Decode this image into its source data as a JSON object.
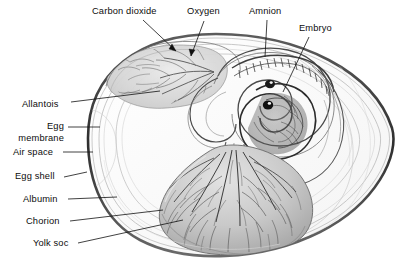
{
  "figure": {
    "style": "pencil-shaded anatomical line drawing, grayscale",
    "background_color": "#ffffff",
    "ink_color": "#1a1a1a"
  },
  "labels": [
    {
      "id": "carbon-dioxide",
      "text": "Carbon dioxide",
      "x": 92,
      "y": 8,
      "align": "left",
      "leader": {
        "type": "arrow",
        "from": [
          143,
          20
        ],
        "to": [
          178,
          52
        ]
      }
    },
    {
      "id": "oxygen",
      "text": "Oxygen",
      "x": 187,
      "y": 8,
      "align": "left",
      "leader": {
        "type": "arrow",
        "from": [
          204,
          20
        ],
        "to": [
          190,
          58
        ]
      }
    },
    {
      "id": "amnion",
      "text": "Amnion",
      "x": 249,
      "y": 8,
      "align": "left",
      "leader": {
        "type": "line",
        "from": [
          267,
          20
        ],
        "to": [
          265,
          56
        ]
      }
    },
    {
      "id": "embryo",
      "text": "Embryo",
      "x": 299,
      "y": 25,
      "align": "left",
      "leader": {
        "type": "line",
        "from": [
          309,
          37
        ],
        "to": [
          283,
          91
        ]
      }
    },
    {
      "id": "allantois",
      "text": "Allantois",
      "x": 22,
      "y": 101,
      "align": "left",
      "leader": {
        "type": "line",
        "from": [
          70,
          105
        ],
        "to": [
          158,
          90
        ]
      }
    },
    {
      "id": "egg-membrane",
      "text": "Egg\nmembrane",
      "lines": [
        "Egg",
        "membrane"
      ],
      "x": 15,
      "y": 124,
      "align": "right",
      "leader": {
        "type": "line",
        "from": [
          68,
          129
        ],
        "to": [
          99,
          129
        ]
      }
    },
    {
      "id": "air-space",
      "text": "Air space",
      "x": 14,
      "y": 150,
      "align": "left",
      "leader": {
        "type": "line",
        "from": [
          63,
          154
        ],
        "to": [
          92,
          154
        ]
      }
    },
    {
      "id": "egg-shell",
      "text": "Egg shell",
      "x": 15,
      "y": 174,
      "align": "left",
      "leader": {
        "type": "line",
        "from": [
          64,
          178
        ],
        "to": [
          86,
          174
        ]
      }
    },
    {
      "id": "albumin",
      "text": "Albumin",
      "x": 23,
      "y": 197,
      "align": "left",
      "leader": {
        "type": "line",
        "from": [
          68,
          201
        ],
        "to": [
          116,
          199
        ]
      }
    },
    {
      "id": "chorion",
      "text": "Chorion",
      "x": 26,
      "y": 219,
      "align": "left",
      "leader": {
        "type": "line",
        "from": [
          70,
          223
        ],
        "to": [
          160,
          212
        ]
      }
    },
    {
      "id": "yolk-soc",
      "text": "Yolk soc",
      "x": 33,
      "y": 241,
      "align": "left",
      "leader": {
        "type": "line",
        "from": [
          78,
          245
        ],
        "to": [
          180,
          222
        ]
      }
    }
  ],
  "structures": [
    {
      "id": "egg-shell-outline",
      "name": "egg shell",
      "shape": "oval",
      "stroke": "#3a3a3a"
    },
    {
      "id": "egg-membrane-outline",
      "name": "egg membrane",
      "shape": "oval-inner",
      "stroke": "#9a9a9a"
    },
    {
      "id": "air-space-region",
      "name": "air space",
      "fill": "#fdfdfd"
    },
    {
      "id": "albumin-region",
      "name": "albumin",
      "fill": "#fbfbfb"
    },
    {
      "id": "chorion-region",
      "name": "chorion",
      "stroke": "#b5b5b5"
    },
    {
      "id": "allantois-region",
      "name": "allantois",
      "fill": "#d8d8d8"
    },
    {
      "id": "amnion-region",
      "name": "amnion",
      "fill": "#c9c9c9"
    },
    {
      "id": "embryo-region",
      "name": "embryo",
      "fill": "#6b6b6b"
    },
    {
      "id": "yolk-sac-region",
      "name": "yolk sac",
      "fill": "#c4c4c4"
    }
  ]
}
